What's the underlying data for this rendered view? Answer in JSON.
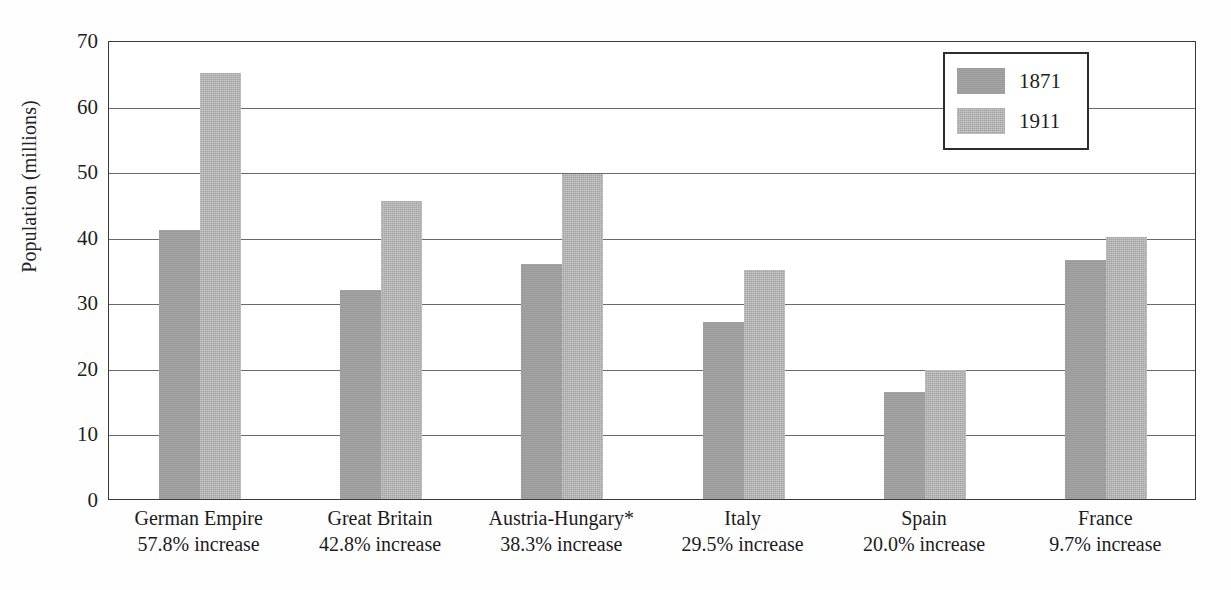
{
  "chart_data": {
    "type": "bar",
    "title": "",
    "xlabel": "",
    "ylabel": "Population (millions)",
    "ylim": [
      0,
      70
    ],
    "ytick_values": [
      0,
      10,
      20,
      30,
      40,
      50,
      60,
      70
    ],
    "ytick_labels": [
      "0",
      "10",
      "20",
      "30",
      "40",
      "50",
      "60",
      "70"
    ],
    "grid": true,
    "legend_position": "top-right",
    "categories": [
      "German Empire",
      "Great Britain",
      "Austria-Hungary*",
      "Italy",
      "Spain",
      "France"
    ],
    "category_sublabels": [
      "57.8% increase",
      "42.8% increase",
      "38.3% increase",
      "29.5% increase",
      "20.0% increase",
      "9.7% increase"
    ],
    "series": [
      {
        "name": "1871",
        "color": "#9a9a9a",
        "values": [
          41.0,
          31.8,
          35.8,
          27.0,
          16.3,
          36.5
        ]
      },
      {
        "name": "1911",
        "color": "#a4a4a4",
        "values": [
          64.9,
          45.5,
          49.6,
          35.0,
          19.6,
          40.0
        ]
      }
    ]
  },
  "legend": {
    "entries": [
      {
        "label": "1871"
      },
      {
        "label": "1911"
      }
    ]
  },
  "axis": {
    "y_title": "Population (millions)"
  }
}
